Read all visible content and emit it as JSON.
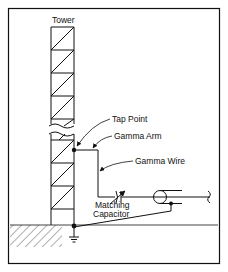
{
  "diagram": {
    "labels": {
      "tower": "Tower",
      "tap_point": "Tap Point",
      "gamma_arm": "Gamma Arm",
      "gamma_wire": "Gamma Wire",
      "matching_capacitor_line1": "Matching",
      "matching_capacitor_line2": "Capacitor"
    },
    "colors": {
      "line": "#111111",
      "background": "#ffffff"
    }
  }
}
